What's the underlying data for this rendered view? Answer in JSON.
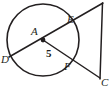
{
  "figure": {
    "kind": "circle-with-secant-and-tangent-geometry-diagram",
    "width": 111,
    "height": 92,
    "stroke_color": "#231f20",
    "background_color": "#ffffff",
    "labels": {
      "center": "A",
      "left_point": "D",
      "upper_point": "E",
      "lower_point": "F",
      "right_point": "C",
      "radius_measure": "5"
    },
    "elements": {
      "circle": {
        "name": "circle-A",
        "center_x": 43,
        "center_y": 40,
        "radius": 36
      },
      "center_dot": {
        "name": "center-point-A",
        "x": 43,
        "y": 40,
        "r": 2.4
      },
      "segment_D_to_C_top": {
        "name": "secant-D-E-to-top-vertex",
        "x1": 9,
        "y1": 57,
        "x2": 103,
        "y2": 3
      },
      "segment_A_to_C_bottom": {
        "name": "radius-A-F-to-bottom-vertex",
        "x1": 43,
        "y1": 40,
        "x2": 100,
        "y2": 78
      },
      "segment_vertical": {
        "name": "vertical-side-of-triangle",
        "x1": 102,
        "y1": 3,
        "x2": 100,
        "y2": 79
      },
      "point_E": {
        "name": "point-E-on-circle",
        "x": 70,
        "y": 24
      },
      "point_F": {
        "name": "point-F-on-circle",
        "x": 70,
        "y": 59
      },
      "point_D": {
        "name": "point-D-on-circle",
        "x": 10,
        "y": 56
      }
    }
  }
}
